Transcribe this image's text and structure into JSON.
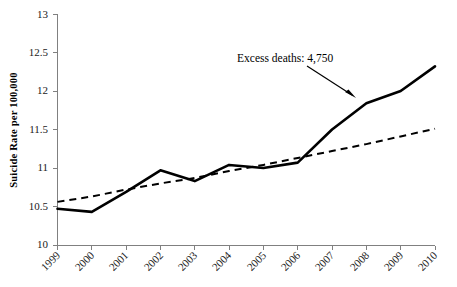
{
  "chart_data": {
    "type": "line",
    "title": "",
    "subtitle": "",
    "xlabel": "",
    "ylabel": "Suicide Rate per 100,000",
    "categories": [
      "1999",
      "2000",
      "2001",
      "2002",
      "2003",
      "2004",
      "2005",
      "2006",
      "2007",
      "2008",
      "2009",
      "2010"
    ],
    "x": [
      1999,
      2000,
      2001,
      2002,
      2003,
      2004,
      2005,
      2006,
      2007,
      2008,
      2009,
      2010
    ],
    "xlim": [
      1999,
      2010
    ],
    "ylim": [
      10,
      13
    ],
    "ytick_labels": [
      "10",
      "10.5",
      "11",
      "11.5",
      "12",
      "12.5",
      "13"
    ],
    "ytick_values": [
      10,
      10.5,
      11,
      11.5,
      12,
      12.5,
      13
    ],
    "xtick_labels": [
      "1999",
      "2000",
      "2001",
      "2002",
      "2003",
      "2004",
      "2005",
      "2006",
      "2007",
      "2008",
      "2009",
      "2010"
    ],
    "grid": false,
    "legend": "none",
    "series": [
      {
        "name": "Observed suicide rate",
        "style": "solid",
        "color": "#000000",
        "values": [
          10.47,
          10.43,
          10.69,
          10.97,
          10.83,
          11.04,
          11.0,
          11.07,
          11.5,
          11.84,
          12.0,
          12.32
        ]
      },
      {
        "name": "Expected trend",
        "style": "dashed",
        "color": "#000000",
        "values": [
          10.56,
          10.63,
          10.72,
          10.8,
          10.87,
          10.96,
          11.04,
          11.13,
          11.22,
          11.31,
          11.41,
          11.51
        ]
      }
    ],
    "annotations": [
      {
        "id": "excess-deaths",
        "text": "Excess deaths: 4,750",
        "text_x": 1905,
        "text_y": 12.62,
        "arrow_from": {
          "x": 2006.4,
          "y": 12.33
        },
        "arrow_to": {
          "x": 2007.8,
          "y": 11.92
        }
      }
    ]
  },
  "annotation": {
    "excess_deaths_label": "Excess deaths: 4,750"
  },
  "axes": {
    "y_title": "Suicide Rate per 100,000",
    "y_ticks": [
      "13",
      "12.5",
      "12",
      "11.5",
      "11",
      "10.5",
      "10"
    ],
    "x_ticks": [
      "1999",
      "2000",
      "2001",
      "2002",
      "2003",
      "2004",
      "2005",
      "2006",
      "2007",
      "2008",
      "2009",
      "2010"
    ]
  },
  "colors": {
    "background": "#ffffff",
    "axis": "#808080",
    "series": "#000000",
    "text": "#000000"
  }
}
